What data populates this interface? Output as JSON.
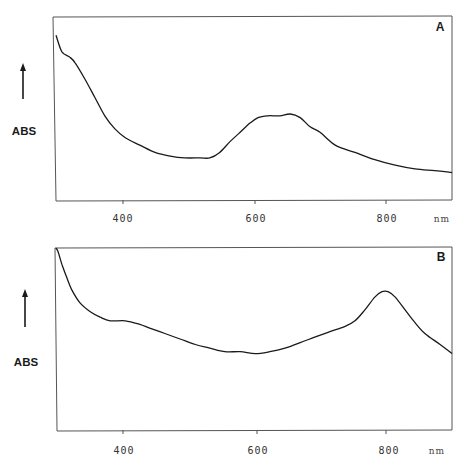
{
  "chart_data": [
    {
      "type": "line",
      "panel": "A",
      "title": "",
      "xlabel": "nm",
      "ylabel": "ABS",
      "xlim": [
        300,
        900
      ],
      "ylim": [
        0,
        1
      ],
      "x_ticks": [
        400,
        600,
        800
      ],
      "grid": false,
      "series": [
        {
          "name": "A",
          "x": [
            300,
            309,
            321,
            329,
            344,
            359,
            374,
            389,
            405,
            427,
            450,
            473,
            495,
            518,
            533,
            548,
            564,
            579,
            594,
            606,
            621,
            639,
            655,
            670,
            685,
            700,
            723,
            753,
            783,
            814,
            844,
            874,
            900
          ],
          "y": [
            0.9,
            0.81,
            0.78,
            0.75,
            0.66,
            0.56,
            0.46,
            0.39,
            0.34,
            0.3,
            0.26,
            0.24,
            0.23,
            0.23,
            0.23,
            0.26,
            0.32,
            0.37,
            0.42,
            0.45,
            0.46,
            0.46,
            0.47,
            0.45,
            0.4,
            0.37,
            0.3,
            0.26,
            0.22,
            0.19,
            0.17,
            0.16,
            0.15
          ]
        }
      ],
      "annotations": [
        "A"
      ]
    },
    {
      "type": "line",
      "panel": "B",
      "title": "",
      "xlabel": "nm",
      "ylabel": "ABS",
      "xlim": [
        300,
        900
      ],
      "ylim": [
        0,
        1
      ],
      "x_ticks": [
        400,
        600,
        800
      ],
      "grid": false,
      "series": [
        {
          "name": "B",
          "x": [
            300,
            303,
            309,
            315,
            324,
            336,
            352,
            367,
            382,
            405,
            427,
            442,
            465,
            488,
            511,
            533,
            556,
            579,
            602,
            624,
            647,
            670,
            692,
            715,
            738,
            753,
            768,
            783,
            794,
            803,
            814,
            829,
            844,
            859,
            882,
            900
          ],
          "y": [
            1.0,
            0.98,
            0.91,
            0.85,
            0.77,
            0.7,
            0.65,
            0.62,
            0.6,
            0.6,
            0.58,
            0.56,
            0.53,
            0.5,
            0.47,
            0.45,
            0.43,
            0.43,
            0.42,
            0.43,
            0.45,
            0.48,
            0.51,
            0.54,
            0.57,
            0.6,
            0.66,
            0.73,
            0.76,
            0.76,
            0.73,
            0.66,
            0.59,
            0.53,
            0.47,
            0.42
          ]
        }
      ],
      "annotations": [
        "B"
      ]
    }
  ],
  "panels": [
    {
      "label": "A",
      "ylabel": "ABS",
      "unit": "nm",
      "ticks": [
        "400",
        "600",
        "800"
      ]
    },
    {
      "label": "B",
      "ylabel": "ABS",
      "unit": "nm",
      "ticks": [
        "400",
        "600",
        "800"
      ]
    }
  ],
  "colors": {
    "line": "#1a1a1a",
    "frame": "#555555",
    "background": "#ffffff"
  }
}
